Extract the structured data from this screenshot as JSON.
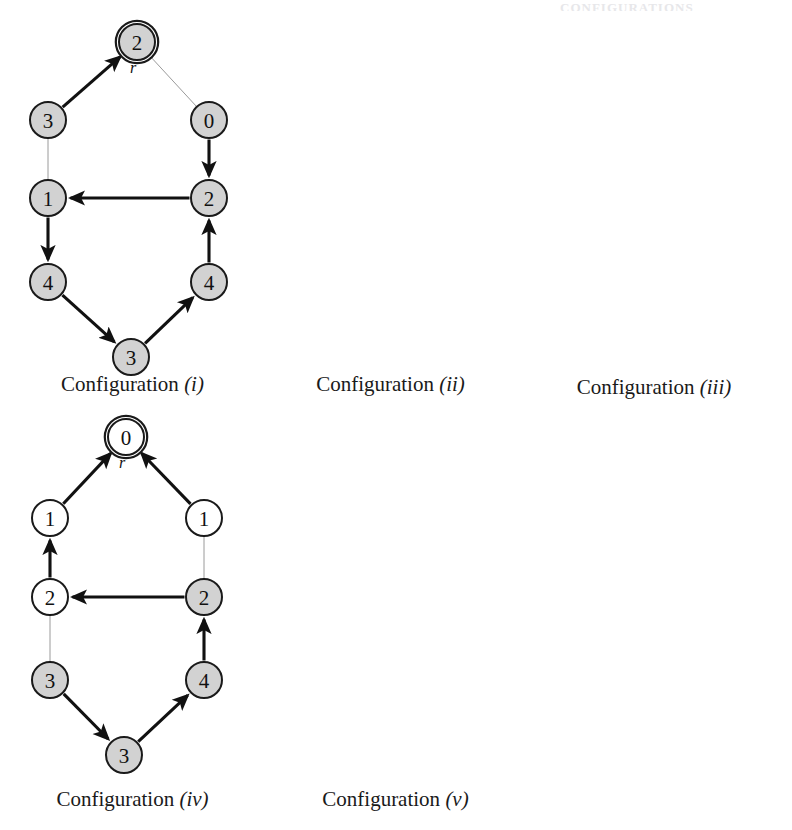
{
  "page": {
    "background": "#ffffff",
    "faint_header_text": "CONFIGURATIONS",
    "node_fill_gray": "#d2d2d2",
    "node_fill_white": "#ffffff",
    "node_stroke": "#1a1a1a",
    "thick_edge_color": "#111111",
    "thin_edge_color": "#9a9a9a",
    "root_marker_label": "r"
  },
  "configurations": [
    {
      "id": "i",
      "caption_prefix": "Configuration",
      "caption_numeral": "(i)",
      "root": {
        "label": "2",
        "fill": "gray",
        "marker": "r"
      },
      "nodes": [
        {
          "id": "root",
          "label": "2",
          "fill": "gray",
          "x": 137,
          "y": 42
        },
        {
          "id": "l1",
          "label": "3",
          "fill": "gray",
          "x": 48,
          "y": 120
        },
        {
          "id": "l2",
          "label": "1",
          "fill": "gray",
          "x": 48,
          "y": 198
        },
        {
          "id": "l3",
          "label": "4",
          "fill": "gray",
          "x": 48,
          "y": 282
        },
        {
          "id": "b",
          "label": "3",
          "fill": "gray",
          "x": 131,
          "y": 357
        },
        {
          "id": "r1",
          "label": "0",
          "fill": "gray",
          "x": 209,
          "y": 120
        },
        {
          "id": "r2",
          "label": "2",
          "fill": "gray",
          "x": 209,
          "y": 198
        },
        {
          "id": "r3",
          "label": "4",
          "fill": "gray",
          "x": 209,
          "y": 282
        }
      ],
      "edges": [
        {
          "from": "l1",
          "to": "root",
          "style": "thick"
        },
        {
          "from": "root",
          "to": "r1",
          "style": "thin"
        },
        {
          "from": "l1",
          "to": "l2",
          "style": "thin"
        },
        {
          "from": "r1",
          "to": "r2",
          "style": "thick"
        },
        {
          "from": "r2",
          "to": "l2",
          "style": "thick"
        },
        {
          "from": "l2",
          "to": "l3",
          "style": "thick"
        },
        {
          "from": "l3",
          "to": "b",
          "style": "thick"
        },
        {
          "from": "b",
          "to": "r3",
          "style": "thick"
        },
        {
          "from": "r3",
          "to": "r2",
          "style": "thick"
        }
      ]
    },
    {
      "id": "ii",
      "caption_prefix": "Configuration",
      "caption_numeral": "(ii)",
      "root": {
        "label": "0",
        "fill": "gray",
        "marker": "r"
      },
      "nodes": [
        {
          "id": "root",
          "label": "0",
          "fill": "gray",
          "x": 137,
          "y": 42
        },
        {
          "id": "l1",
          "label": "2",
          "fill": "gray",
          "x": 48,
          "y": 120
        },
        {
          "id": "l2",
          "label": "3",
          "fill": "gray",
          "x": 48,
          "y": 198
        },
        {
          "id": "l3",
          "label": "2",
          "fill": "gray",
          "x": 48,
          "y": 282
        },
        {
          "id": "b",
          "label": "4",
          "fill": "gray",
          "x": 131,
          "y": 357
        },
        {
          "id": "r1",
          "label": "3",
          "fill": "gray",
          "x": 209,
          "y": 120
        },
        {
          "id": "r2",
          "label": "1",
          "fill": "gray",
          "x": 209,
          "y": 198
        },
        {
          "id": "r3",
          "label": "3",
          "fill": "gray",
          "x": 209,
          "y": 282
        }
      ],
      "edges": [
        {
          "from": "l1",
          "to": "root",
          "style": "thick"
        },
        {
          "from": "root",
          "to": "r1",
          "style": "thin"
        },
        {
          "from": "l1",
          "to": "l2",
          "style": "thin"
        },
        {
          "from": "r1",
          "to": "r2",
          "style": "thick"
        },
        {
          "from": "r2",
          "to": "l2",
          "style": "thick"
        },
        {
          "from": "l2",
          "to": "l3",
          "style": "thick"
        },
        {
          "from": "l3",
          "to": "b",
          "style": "thick"
        },
        {
          "from": "b",
          "to": "r3",
          "style": "thick"
        },
        {
          "from": "r3",
          "to": "r2",
          "style": "thick"
        }
      ]
    },
    {
      "id": "iii",
      "caption_prefix": "Configuration",
      "caption_numeral": "(iii)",
      "root": {
        "label": "0",
        "fill": "white",
        "marker": "r"
      },
      "nodes": [
        {
          "id": "root",
          "label": "0",
          "fill": "white",
          "x": 152,
          "y": 42
        },
        {
          "id": "l1",
          "label": "1",
          "fill": "white",
          "x": 63,
          "y": 123
        },
        {
          "id": "l2",
          "label": "2",
          "fill": "gray",
          "x": 63,
          "y": 201
        },
        {
          "id": "l3",
          "label": "4",
          "fill": "gray",
          "x": 63,
          "y": 285
        },
        {
          "id": "b",
          "label": "3",
          "fill": "white",
          "x": 146,
          "y": 360
        },
        {
          "id": "r1",
          "label": "1",
          "fill": "gray",
          "x": 226,
          "y": 123
        },
        {
          "id": "r2",
          "label": "4",
          "fill": "gray",
          "x": 226,
          "y": 201
        },
        {
          "id": "r3",
          "label": "2",
          "fill": "gray",
          "x": 226,
          "y": 285
        }
      ],
      "edges": [
        {
          "from": "l1",
          "to": "root",
          "style": "thick"
        },
        {
          "from": "root",
          "to": "r1",
          "style": "thin"
        },
        {
          "from": "l1",
          "to": "l2",
          "style": "thin"
        },
        {
          "from": "r1",
          "to": "r2",
          "style": "thick"
        },
        {
          "from": "r2",
          "to": "l2",
          "style": "thick"
        },
        {
          "from": "l2",
          "to": "l3",
          "style": "thick"
        },
        {
          "from": "l3",
          "to": "b",
          "style": "thick"
        },
        {
          "from": "b",
          "to": "r3",
          "style": "thick"
        },
        {
          "from": "r3",
          "to": "r2",
          "style": "thick"
        }
      ]
    },
    {
      "id": "iv",
      "caption_prefix": "Configuration",
      "caption_numeral": "(iv)",
      "root": {
        "label": "0",
        "fill": "white",
        "marker": "r"
      },
      "nodes": [
        {
          "id": "root",
          "label": "0",
          "fill": "white",
          "x": 126,
          "y": 437
        },
        {
          "id": "l1",
          "label": "1",
          "fill": "white",
          "x": 50,
          "y": 518
        },
        {
          "id": "l2",
          "label": "2",
          "fill": "white",
          "x": 50,
          "y": 597
        },
        {
          "id": "l3",
          "label": "3",
          "fill": "gray",
          "x": 50,
          "y": 680
        },
        {
          "id": "b",
          "label": "3",
          "fill": "gray",
          "x": 124,
          "y": 755
        },
        {
          "id": "r1",
          "label": "1",
          "fill": "white",
          "x": 204,
          "y": 518
        },
        {
          "id": "r2",
          "label": "2",
          "fill": "gray",
          "x": 204,
          "y": 597
        },
        {
          "id": "r3",
          "label": "4",
          "fill": "gray",
          "x": 204,
          "y": 680
        }
      ],
      "edges": [
        {
          "from": "l1",
          "to": "root",
          "style": "thick"
        },
        {
          "from": "r1",
          "to": "root",
          "style": "thick"
        },
        {
          "from": "l2",
          "to": "l1",
          "style": "thick"
        },
        {
          "from": "r1",
          "to": "r2",
          "style": "thin"
        },
        {
          "from": "r2",
          "to": "l2",
          "style": "thick"
        },
        {
          "from": "l2",
          "to": "l3",
          "style": "thin"
        },
        {
          "from": "l3",
          "to": "b",
          "style": "thick"
        },
        {
          "from": "b",
          "to": "r3",
          "style": "thick"
        },
        {
          "from": "r3",
          "to": "r2",
          "style": "thick"
        }
      ]
    },
    {
      "id": "v",
      "caption_prefix": "Configuration",
      "caption_numeral": "(v)",
      "root": {
        "label": "0",
        "fill": "white",
        "marker": "r"
      },
      "nodes": [
        {
          "id": "root",
          "label": "0",
          "fill": "white",
          "x": 146,
          "y": 437
        },
        {
          "id": "l1",
          "label": "1",
          "fill": "white",
          "x": 69,
          "y": 523
        },
        {
          "id": "l2",
          "label": "2",
          "fill": "white",
          "x": 69,
          "y": 601
        },
        {
          "id": "l3",
          "label": "3",
          "fill": "white",
          "x": 69,
          "y": 681
        },
        {
          "id": "b",
          "label": "4",
          "fill": "white",
          "x": 148,
          "y": 757
        },
        {
          "id": "r1",
          "label": "1",
          "fill": "white",
          "x": 225,
          "y": 523
        },
        {
          "id": "r2",
          "label": "2",
          "fill": "white",
          "x": 225,
          "y": 601
        },
        {
          "id": "r3",
          "label": "3",
          "fill": "white",
          "x": 225,
          "y": 681
        }
      ],
      "edges": [
        {
          "from": "l1",
          "to": "root",
          "style": "thick"
        },
        {
          "from": "r1",
          "to": "root",
          "style": "thick"
        },
        {
          "from": "l2",
          "to": "l1",
          "style": "thick"
        },
        {
          "from": "r2",
          "to": "r1",
          "style": "thick"
        },
        {
          "from": "l2",
          "to": "r2",
          "style": "thin"
        },
        {
          "from": "l3",
          "to": "l2",
          "style": "thick"
        },
        {
          "from": "r3",
          "to": "r2",
          "style": "thick"
        },
        {
          "from": "l3",
          "to": "b",
          "style": "thin"
        },
        {
          "from": "b",
          "to": "r3",
          "style": "thick"
        }
      ]
    }
  ],
  "layout": {
    "panels": [
      {
        "id": "i",
        "left": 0,
        "top": 0,
        "width": 265,
        "height": 410,
        "caption_top": 372
      },
      {
        "id": "ii",
        "left": 258,
        "top": 0,
        "width": 265,
        "height": 410,
        "caption_top": 372
      },
      {
        "id": "iii",
        "left": 516,
        "top": 0,
        "width": 276,
        "height": 410,
        "caption_top": 375
      },
      {
        "id": "iv",
        "left": 0,
        "top": 0,
        "width": 265,
        "height": 830,
        "caption_top": 787
      },
      {
        "id": "v",
        "left": 258,
        "top": 0,
        "width": 275,
        "height": 830,
        "caption_top": 787
      }
    ]
  }
}
